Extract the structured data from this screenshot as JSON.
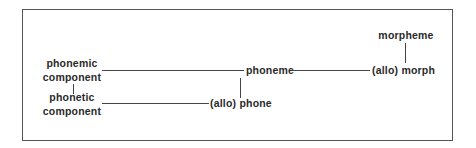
{
  "diagram": {
    "nodes": {
      "morpheme": "morpheme",
      "allo_morph": "(allo) morph",
      "phoneme": "phoneme",
      "allo_phone": "(allo) phone",
      "phonemic_component": [
        "phonemic",
        "component"
      ],
      "phonetic_component": [
        "phonetic",
        "component"
      ]
    },
    "edges": [
      {
        "from": "morpheme",
        "to": "(allo) morph",
        "type": "vertical"
      },
      {
        "from": "phoneme",
        "to": "(allo) morph",
        "type": "horizontal"
      },
      {
        "from": "phonemic component",
        "to": "phoneme",
        "type": "horizontal"
      },
      {
        "from": "phoneme",
        "to": "(allo) phone",
        "type": "vertical"
      },
      {
        "from": "phonetic component",
        "to": "(allo) phone",
        "type": "horizontal"
      },
      {
        "from": "phonemic component",
        "to": "phonetic component",
        "type": "vertical"
      }
    ]
  }
}
